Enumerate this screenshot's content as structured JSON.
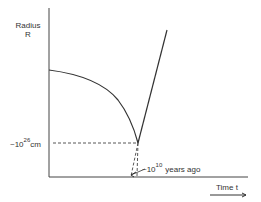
{
  "diagram": {
    "axes": {
      "y_label_line1": "Radius",
      "y_label_line2": "R",
      "x_label": "Time  t"
    },
    "annotations": {
      "radius_value_prefix": "~10",
      "radius_value_exp": "26",
      "radius_value_unit": "cm",
      "time_value_prefix": "~10",
      "time_value_exp": "10",
      "time_value_suffix": "years  ago"
    },
    "colors": {
      "line": "#333333",
      "background": "#ffffff"
    }
  }
}
